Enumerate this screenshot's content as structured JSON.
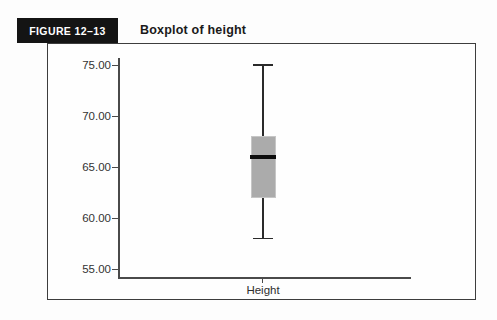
{
  "header": {
    "figure_label": "FIGURE 12–13",
    "title": "Boxplot of height"
  },
  "chart_data": {
    "type": "boxplot",
    "title": "Boxplot of height",
    "categories": [
      "Height"
    ],
    "series": [
      {
        "name": "Height",
        "min": 58,
        "q1": 62,
        "median": 66,
        "q3": 68,
        "max": 75
      }
    ],
    "xlabel": "Height",
    "ylabel": "",
    "ylim": [
      53.5,
      76.5
    ],
    "yticks": [
      {
        "value": 75,
        "label": "75.00"
      },
      {
        "value": 70,
        "label": "70.00"
      },
      {
        "value": 65,
        "label": "65.00"
      },
      {
        "value": 60,
        "label": "60.00"
      },
      {
        "value": 55,
        "label": "55.00"
      }
    ],
    "grid": false,
    "legend": false
  },
  "colors": {
    "box_fill": "#ababab",
    "box_border": "#c6c6c6",
    "median": "#0d0d0d",
    "axis_line": "#4a4a4a",
    "frame_border": "#3d3d3d",
    "header_bg": "#141414",
    "header_text": "#ffffff"
  }
}
